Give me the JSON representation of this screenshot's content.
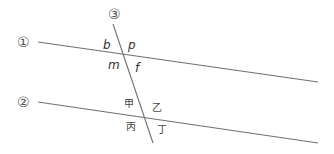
{
  "diagram": {
    "lines": [
      {
        "id": "line-1",
        "label": "①",
        "x1": 38,
        "y1": 42,
        "x2": 318,
        "y2": 82,
        "label_x": 17,
        "label_y": 47
      },
      {
        "id": "line-2",
        "label": "②",
        "x1": 38,
        "y1": 102,
        "x2": 318,
        "y2": 143,
        "label_x": 17,
        "label_y": 107
      },
      {
        "id": "line-3",
        "label": "③",
        "x1": 113,
        "y1": 24,
        "x2": 153,
        "y2": 143,
        "label_x": 108,
        "label_y": 19
      }
    ],
    "angle_labels": [
      {
        "id": "b",
        "text": "b",
        "x": 103,
        "y": 49,
        "style": "latin"
      },
      {
        "id": "p",
        "text": "p",
        "x": 128,
        "y": 49,
        "style": "latin"
      },
      {
        "id": "m",
        "text": "m",
        "x": 108,
        "y": 69,
        "style": "latin"
      },
      {
        "id": "f",
        "text": "f",
        "x": 135,
        "y": 72,
        "style": "latin"
      },
      {
        "id": "jia",
        "text": "甲",
        "x": 124,
        "y": 107,
        "style": "cjk"
      },
      {
        "id": "yi",
        "text": "乙",
        "x": 152,
        "y": 111,
        "style": "cjk"
      },
      {
        "id": "bing",
        "text": "丙",
        "x": 126,
        "y": 130,
        "style": "cjk"
      },
      {
        "id": "ding",
        "text": "丁",
        "x": 157,
        "y": 133,
        "style": "cjk"
      }
    ],
    "colors": {
      "line": "#707070",
      "label": "#555555",
      "angle": "#333333"
    }
  }
}
